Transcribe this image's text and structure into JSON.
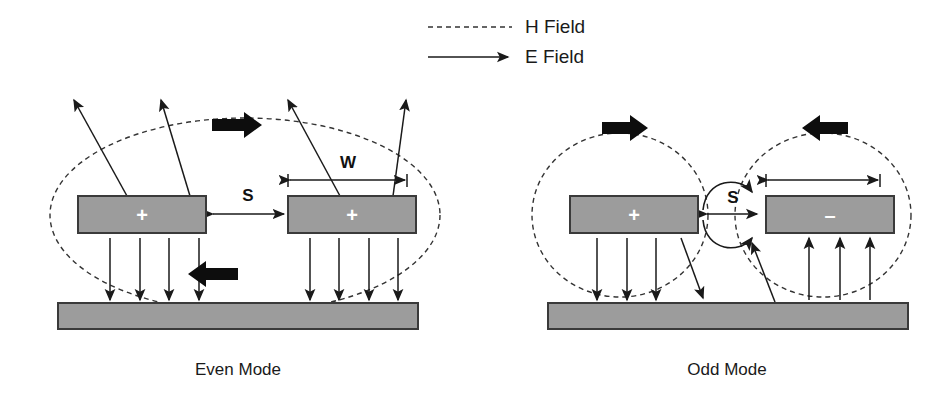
{
  "figure": {
    "background_color": "#ffffff",
    "ink_color": "#1a1a1a",
    "conductor_fill": "#9c9c9c",
    "conductor_stroke": "#3a3a3a",
    "block_arrow_color": "#0d0d0d"
  },
  "legend": {
    "position": "top-center",
    "items": [
      {
        "label": "H Field",
        "line_style": "dashed",
        "has_arrowhead": false,
        "icon": "dashed-line-icon"
      },
      {
        "label": "E Field",
        "line_style": "solid",
        "has_arrowhead": true,
        "icon": "solid-arrow-icon"
      }
    ]
  },
  "panels": [
    {
      "id": "even",
      "label": "Even Mode",
      "conductors": [
        {
          "id": "even-left-strip",
          "charge": "+",
          "sign_label": "+"
        },
        {
          "id": "even-right-strip",
          "charge": "+",
          "sign_label": "+"
        }
      ],
      "dimensions": [
        {
          "id": "even-w",
          "label": "W",
          "measures": "strip-width",
          "shown": true
        },
        {
          "id": "even-s",
          "label": "S",
          "measures": "strip-separation",
          "shown": true
        }
      ],
      "h_field": {
        "shape": "single-enclosing-ellipse",
        "count": 1,
        "direction_markers": [
          {
            "id": "even-h-top",
            "direction": "right",
            "position": "top"
          },
          {
            "id": "even-h-bottom",
            "direction": "left",
            "position": "bottom"
          }
        ]
      },
      "e_field": {
        "fringing_arrows_up": 4,
        "ground_arrows_left": 4,
        "ground_arrows_right": 4,
        "ground_arrow_direction": "down",
        "between_strips": "none-outward"
      },
      "ground_plane": {
        "id": "even-ground",
        "present": true
      }
    },
    {
      "id": "odd",
      "label": "Odd Mode",
      "conductors": [
        {
          "id": "odd-left-strip",
          "charge": "+",
          "sign_label": "+"
        },
        {
          "id": "odd-right-strip",
          "charge": "-",
          "sign_label": "–"
        }
      ],
      "dimensions": [
        {
          "id": "odd-w",
          "label": "",
          "measures": "strip-width",
          "shown": true
        },
        {
          "id": "odd-s",
          "label": "S",
          "measures": "strip-separation",
          "shown": true
        }
      ],
      "h_field": {
        "shape": "two-separate-ellipses",
        "count": 2,
        "direction_markers": [
          {
            "id": "odd-h-left",
            "direction": "right",
            "position": "top-left"
          },
          {
            "id": "odd-h-right",
            "direction": "left",
            "position": "top-right"
          }
        ]
      },
      "e_field": {
        "coupling_arrows": 3,
        "coupling_direction": "left-to-right",
        "ground_arrows_left": 4,
        "ground_arrows_left_direction": "down",
        "ground_arrows_right": 3,
        "ground_arrows_right_direction": "up"
      },
      "ground_plane": {
        "id": "odd-ground",
        "present": true
      }
    }
  ]
}
